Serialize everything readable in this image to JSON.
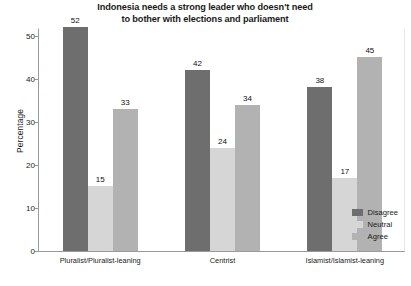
{
  "chart_data": {
    "type": "bar",
    "title": "Indonesia needs a strong leader who doesn't need to bother with elections and parliament",
    "title_line1": "Indonesia needs a strong leader who doesn't need",
    "title_line2": "to bother with elections and parliament",
    "xlabel": "",
    "ylabel": "Percentage",
    "ylim": [
      0,
      52
    ],
    "yticks": [
      0,
      10,
      20,
      30,
      40,
      50
    ],
    "ytick_labels": [
      "0",
      "10",
      "20",
      "30",
      "40",
      "50"
    ],
    "grid": false,
    "legend_position": "inside-bottom-right",
    "categories": [
      "Pluralist/Pluralist-leaning",
      "Centrist",
      "Islamist/Islamist-leaning"
    ],
    "series": [
      {
        "name": "Disagree",
        "color": "#6e6e6e",
        "values": [
          52,
          42,
          38
        ]
      },
      {
        "name": "Neutral",
        "color": "#d6d6d6",
        "values": [
          15,
          24,
          17
        ]
      },
      {
        "name": "Agree",
        "color": "#b2b2b2",
        "values": [
          33,
          34,
          45
        ]
      }
    ]
  },
  "axis": {
    "tick_0": "0",
    "tick_10": "10",
    "tick_20": "20",
    "tick_30": "30",
    "tick_40": "40",
    "tick_50": "50"
  }
}
